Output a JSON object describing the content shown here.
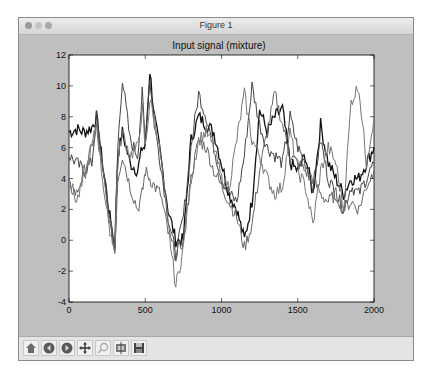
{
  "window": {
    "title": "Figure 1"
  },
  "toolbar": {
    "buttons": [
      {
        "name": "home",
        "icon": "home-icon",
        "label": "Home"
      },
      {
        "name": "back",
        "icon": "back-arrow-icon",
        "label": "Back"
      },
      {
        "name": "forward",
        "icon": "forward-arrow-icon",
        "label": "Forward"
      },
      {
        "name": "pan",
        "icon": "pan-move-icon",
        "label": "Pan"
      },
      {
        "name": "zoom",
        "icon": "zoom-rect-icon",
        "label": "Zoom"
      },
      {
        "name": "subplots",
        "icon": "subplots-config-icon",
        "label": "Configure subplots"
      },
      {
        "name": "save",
        "icon": "save-floppy-icon",
        "label": "Save"
      }
    ]
  },
  "chart_data": {
    "type": "line",
    "title": "Input signal (mixture)",
    "xlabel": "",
    "ylabel": "",
    "xlim": [
      0,
      2000
    ],
    "ylim": [
      -4,
      12
    ],
    "xticks": [
      0,
      500,
      1000,
      1500,
      2000
    ],
    "yticks": [
      -4,
      -2,
      0,
      2,
      4,
      6,
      8,
      10,
      12
    ],
    "grid": false,
    "legend": null,
    "x": [
      0,
      50,
      100,
      150,
      180,
      220,
      260,
      300,
      320,
      350,
      400,
      450,
      480,
      500,
      530,
      560,
      600,
      650,
      700,
      750,
      800,
      850,
      900,
      950,
      1000,
      1050,
      1100,
      1150,
      1200,
      1250,
      1300,
      1350,
      1400,
      1450,
      1500,
      1550,
      1600,
      1650,
      1700,
      1750,
      1800,
      1850,
      1900,
      1950,
      2000
    ],
    "series": [
      {
        "name": "signal 1",
        "color": "#111111",
        "values": [
          7.0,
          7.2,
          7.0,
          7.3,
          8.0,
          5.0,
          2.0,
          -0.5,
          5.5,
          7.0,
          5.0,
          4.5,
          6.0,
          6.0,
          11.0,
          8.0,
          5.5,
          2.0,
          0.0,
          0.0,
          6.5,
          8.0,
          7.5,
          7.0,
          5.0,
          3.0,
          2.0,
          0.0,
          2.5,
          8.5,
          7.0,
          8.0,
          8.5,
          5.0,
          4.5,
          5.5,
          3.0,
          7.5,
          5.0,
          4.0,
          3.0,
          4.0,
          4.0,
          5.0,
          6.0
        ]
      },
      {
        "name": "signal 2",
        "color": "#444444",
        "values": [
          5.5,
          5.0,
          4.5,
          5.0,
          8.0,
          5.0,
          2.0,
          -0.2,
          6.0,
          10.5,
          6.5,
          5.5,
          9.5,
          6.5,
          10.5,
          7.5,
          5.0,
          1.5,
          -1.0,
          1.5,
          6.0,
          9.5,
          8.0,
          6.0,
          4.0,
          3.0,
          2.5,
          5.5,
          10.0,
          7.5,
          6.0,
          5.5,
          5.0,
          8.0,
          6.0,
          5.0,
          3.5,
          6.5,
          4.0,
          3.0,
          2.0,
          3.5,
          3.0,
          4.0,
          5.0
        ]
      },
      {
        "name": "signal 3",
        "color": "#666666",
        "values": [
          3.5,
          3.0,
          4.5,
          6.0,
          7.5,
          4.5,
          1.5,
          -0.8,
          4.0,
          5.5,
          3.5,
          2.0,
          3.0,
          4.5,
          4.0,
          3.5,
          3.0,
          0.5,
          -1.0,
          0.0,
          4.0,
          6.5,
          6.0,
          4.5,
          3.5,
          2.5,
          1.5,
          -0.5,
          1.0,
          4.5,
          7.0,
          9.5,
          7.5,
          5.5,
          5.0,
          4.5,
          4.0,
          3.0,
          2.5,
          3.0,
          2.0,
          2.5,
          2.0,
          3.5,
          4.5
        ]
      },
      {
        "name": "signal 4",
        "color": "#777777",
        "values": [
          4.0,
          2.5,
          4.0,
          6.0,
          7.5,
          4.0,
          1.0,
          -0.5,
          5.0,
          7.0,
          5.5,
          6.0,
          8.5,
          6.0,
          9.0,
          8.0,
          5.5,
          1.0,
          -3.0,
          -0.5,
          4.0,
          6.5,
          7.0,
          6.0,
          4.0,
          3.5,
          6.5,
          9.5,
          6.5,
          5.5,
          4.0,
          3.0,
          3.5,
          7.0,
          4.5,
          3.5,
          1.0,
          4.5,
          6.0,
          5.0,
          2.0,
          9.0,
          10.0,
          5.0,
          8.0
        ]
      }
    ]
  }
}
